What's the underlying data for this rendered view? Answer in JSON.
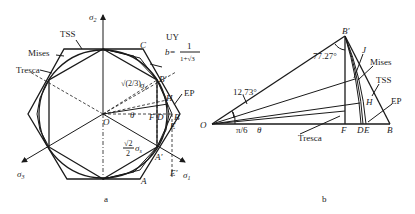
{
  "figure_a": {
    "caption": "a",
    "axes": {
      "sigma1": "σ",
      "sigma1_sub": "1",
      "sigma2": "σ",
      "sigma2_sub": "2",
      "sigma3": "σ",
      "sigma3_sub": "3"
    },
    "origin": "O",
    "criteria_labels": {
      "tss": "TSS",
      "mises": "Mises",
      "tresca": "Tresca",
      "uy": "UY",
      "uy_b": "b=",
      "uy_b_num": "1",
      "uy_b_den": "1+√3",
      "ep": "EP"
    },
    "points": {
      "C": "C",
      "B_prime": "B′",
      "H": "H",
      "B": "B",
      "E": "E",
      "D": "D",
      "F": "F",
      "A_prime": "A′",
      "A": "A",
      "E_prime": "E′"
    },
    "annotations": {
      "radius_upper_coef": "√(2/3)",
      "radius_upper_sym": "σ",
      "radius_upper_sub": "s",
      "radius_lower_num": "√2",
      "radius_lower_den": "2",
      "radius_lower_sym": "σ",
      "radius_lower_sub": "s",
      "theta": "θ"
    }
  },
  "figure_b": {
    "caption": "b",
    "origin": "O",
    "angles": {
      "top_left": "12.73°",
      "top_right": "77.27°",
      "pi_over_6": "π/6",
      "theta": "θ"
    },
    "points": {
      "B_prime": "B′",
      "J": "J",
      "H": "H",
      "F": "F",
      "D": "D",
      "E": "E",
      "B": "B"
    },
    "criteria_labels": {
      "mises": "Mises",
      "tss": "TSS",
      "ep": "EP",
      "tresca": "Tresca"
    }
  }
}
